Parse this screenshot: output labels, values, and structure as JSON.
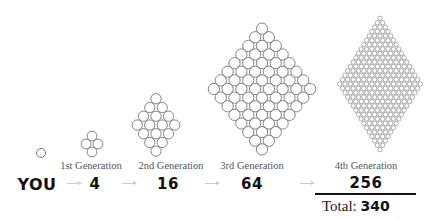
{
  "diagram": {
    "you": {
      "label": "YOU"
    },
    "generations": [
      {
        "label": "1st Generation",
        "count": "4",
        "grid": 2
      },
      {
        "label": "2nd Generation",
        "count": "16",
        "grid": 4
      },
      {
        "label": "3rd Generation",
        "count": "64",
        "grid": 8
      },
      {
        "label": "4th Generation",
        "count": "256",
        "grid": 16
      }
    ],
    "total": {
      "label": "Total:",
      "value": "340"
    },
    "colors": {
      "circle_stroke": "#777777",
      "arrow": "#cccccc",
      "text": "#111111"
    }
  }
}
